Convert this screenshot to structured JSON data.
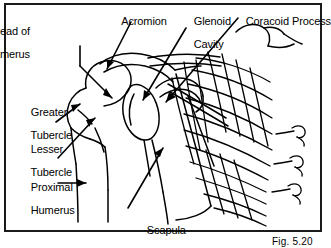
{
  "figure": {
    "caption": "Fig. 5.20",
    "frame_color": "#1a1a1a",
    "background_color": "#ffffff",
    "ink_color": "#000000"
  },
  "labels": [
    {
      "id": "head-of-humerus",
      "text": "Head of\nHumerus",
      "line1": "Head of",
      "line2": "Humerus",
      "align": "right",
      "x": 30,
      "y": 14
    },
    {
      "id": "acromion",
      "text": "Acromion",
      "line1": "Acromion",
      "line2": "",
      "align": "left",
      "x": 104,
      "y": 4
    },
    {
      "id": "glenoid-cavity",
      "text": "Glenoid\nCavity",
      "line1": "Glenoid",
      "line2": "Cavity",
      "align": "left",
      "x": 176,
      "y": 4
    },
    {
      "id": "coracoid-process",
      "text": "Coracoid Process",
      "line1": "Coracoid Process",
      "line2": "",
      "align": "left",
      "x": 228,
      "y": 4
    },
    {
      "id": "greater-tubercle",
      "text": "Greater\nTubercle",
      "line1": "Greater",
      "line2": "Tubercle",
      "align": "left",
      "x": 13,
      "y": 95
    },
    {
      "id": "lesser-tubercle",
      "text": "Lesser\nTubercle",
      "line1": "Lesser",
      "line2": "Tubercle",
      "align": "left",
      "x": 13,
      "y": 132
    },
    {
      "id": "proximal-humerus",
      "text": "Proximal\nHumerus",
      "line1": "Proximal",
      "line2": "Humerus",
      "align": "left",
      "x": 13,
      "y": 170
    },
    {
      "id": "scapula",
      "text": "Scapula",
      "line1": "Scapula",
      "line2": "",
      "align": "left",
      "x": 129,
      "y": 213
    }
  ]
}
